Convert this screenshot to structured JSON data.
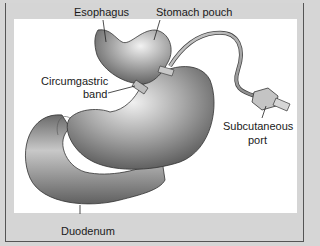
{
  "figure": {
    "labels": {
      "esophagus": "Esophagus",
      "stomach_pouch": "Stomach pouch",
      "band_line1": "Circumgastric",
      "band_line2": "band",
      "port_line1": "Subcutaneous",
      "port_line2": "port",
      "duodenum": "Duodenum"
    },
    "colors": {
      "background": "#d6d6d6",
      "panel": "#ffffff",
      "organ_dark": "#5a5a5a",
      "organ_mid": "#9a9a9a",
      "organ_light": "#e2e2e2",
      "leader_line": "#222222"
    }
  }
}
